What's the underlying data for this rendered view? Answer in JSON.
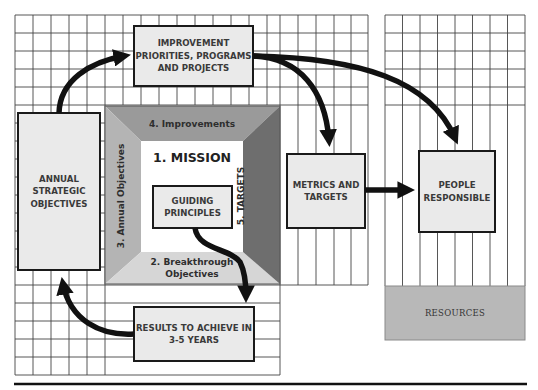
{
  "diagram": {
    "boxes": {
      "improvement": "IMPROVEMENT\nPRIORITIES, PROGRAMS\nAND PROJECTS",
      "annual_strategic": "ANNUAL\nSTRATEGIC\nOBJECTIVES",
      "guiding": "GUIDING\nPRINCIPLES",
      "results": "RESULTS TO ACHIEVE IN\n3-5 YEARS",
      "metrics": "METRICS AND\nTARGETS",
      "people": "PEOPLE\nRESPONSIBLE",
      "resources": "RESOURCES"
    },
    "frame": {
      "center": "1. MISSION",
      "bottom": "2. Breakthrough\nObjectives",
      "left": "3. Annual Objectives",
      "top": "4. Improvements",
      "right": "5. TARGETS"
    },
    "colors": {
      "box_fill": "#eaeaea",
      "frame_top": "#9a9a9a",
      "frame_left": "#b4b4b4",
      "frame_bottom": "#d6d6d6",
      "frame_right": "#6e6e6e",
      "resources_fill": "#b8b8b8",
      "arrow": "#111111"
    },
    "connections": [
      {
        "from": "annual_strategic",
        "to": "improvement"
      },
      {
        "from": "improvement",
        "to": "metrics"
      },
      {
        "from": "improvement",
        "to": "people"
      },
      {
        "from": "metrics",
        "to": "people"
      },
      {
        "from": "guiding",
        "to": "results"
      },
      {
        "from": "results",
        "to": "annual_strategic"
      }
    ]
  }
}
